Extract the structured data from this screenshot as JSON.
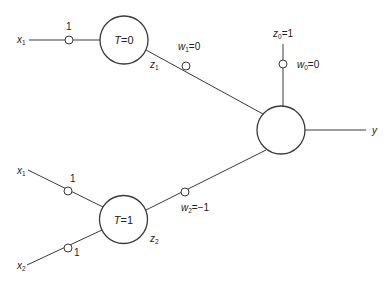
{
  "diagram": {
    "type": "neural-network",
    "nodes": {
      "hidden_top": {
        "label_var": "T",
        "label_eq": "=0",
        "output": "z",
        "output_sub": "1"
      },
      "hidden_bottom": {
        "label_var": "T",
        "label_eq": "=1",
        "output": "z",
        "output_sub": "2"
      },
      "output_unit": {
        "label": "",
        "output": "y"
      }
    },
    "inputs": {
      "top_x1": {
        "var": "x",
        "sub": "1",
        "weight": "1"
      },
      "bottom_x1": {
        "var": "x",
        "sub": "1",
        "weight": "1"
      },
      "bottom_x2": {
        "var": "x",
        "sub": "2",
        "weight": "1"
      }
    },
    "bias": {
      "var": "z",
      "sub": "0",
      "value": "=1",
      "weight_var": "w",
      "weight_sub": "0",
      "weight_value": "=0"
    },
    "weights": {
      "w1": {
        "var": "w",
        "sub": "1",
        "value": "=0"
      },
      "w2": {
        "var": "w",
        "sub": "2",
        "value": "=−1"
      }
    },
    "output_label": "y"
  }
}
